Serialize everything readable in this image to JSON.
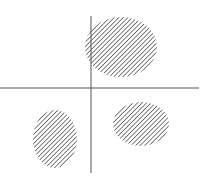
{
  "diagram": {
    "type": "quadrant-clusters",
    "axes": {
      "color": "#555555",
      "horizontal": {
        "x1": 0,
        "x2": 199,
        "y": 88
      },
      "vertical": {
        "x": 91,
        "y1": 16,
        "y2": 173
      }
    },
    "hatch": {
      "color": "#555555",
      "angle": 45,
      "spacing": 3.2,
      "stroke_width": 1.5
    },
    "clusters": [
      {
        "name": "top-cluster",
        "cx": 121,
        "cy": 47,
        "rx": 36,
        "ry": 30
      },
      {
        "name": "bottom-left-cluster",
        "cx": 55,
        "cy": 139,
        "rx": 22,
        "ry": 29
      },
      {
        "name": "bottom-right-cluster",
        "cx": 141,
        "cy": 124,
        "rx": 28,
        "ry": 22
      }
    ]
  }
}
